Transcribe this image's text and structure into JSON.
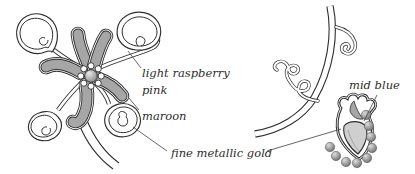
{
  "labels": {
    "light_raspberry_line1": "light raspberry",
    "light_raspberry_line2": "pink",
    "maroon": "maroon",
    "fine_metallic_gold": "fine metallic gold",
    "mid_blue": "mid blue"
  },
  "palette": {
    "ink": "#2e2e2e",
    "petal_gray": "#a6a6a6",
    "bud_gray": "#cfcfcf",
    "leader": "#4a4a4a",
    "background": "#ffffff"
  }
}
